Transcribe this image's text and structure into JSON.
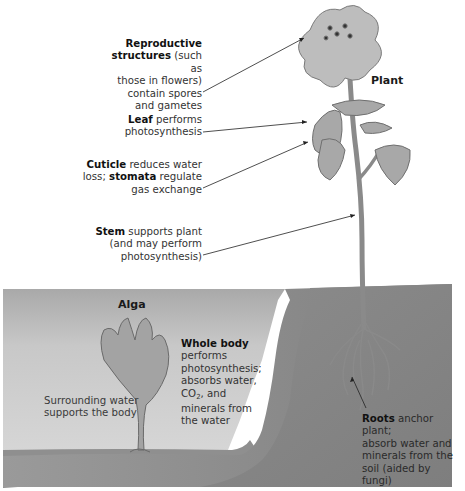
{
  "figure": {
    "organisms": {
      "plant": "Plant",
      "alga": "Alga"
    },
    "plant_labels": [
      {
        "id": "reproductive",
        "bold": "Reproductive structures",
        "text_lines": [
          "Reproductive",
          "structures (such as",
          "those in flowers)",
          "contain spores",
          "and gametes"
        ]
      },
      {
        "id": "leaf",
        "bold": "Leaf",
        "text_lines": [
          "Leaf performs",
          "photosynthesis"
        ]
      },
      {
        "id": "cuticle",
        "bold": [
          "Cuticle",
          "stomata"
        ],
        "text_lines": [
          "Cuticle reduces water",
          "loss; stomata regulate",
          "gas exchange"
        ]
      },
      {
        "id": "stem",
        "bold": "Stem",
        "text_lines": [
          "Stem supports plant",
          "(and may perform",
          "photosynthesis)"
        ]
      },
      {
        "id": "roots",
        "bold": "Roots",
        "text_lines": [
          "Roots anchor plant;",
          "absorb water and",
          "minerals from the",
          "soil (aided by fungi)"
        ]
      }
    ],
    "alga_labels": [
      {
        "id": "surrounding-water",
        "text_lines": [
          "Surrounding water",
          "supports the body"
        ]
      },
      {
        "id": "whole-body",
        "bold": "Whole body",
        "text_lines": [
          "Whole body",
          "performs",
          "photosynthesis;",
          "absorbs water,",
          "CO2, and",
          "minerals from",
          "the water"
        ]
      }
    ],
    "text": {
      "repro_bold1": "Reproductive",
      "repro_bold2": "structures",
      "repro_rest2": " (such as",
      "repro_l3": "those in flowers)",
      "repro_l4": "contain spores",
      "repro_l5": "and gametes",
      "leaf_bold": "Leaf",
      "leaf_rest": " performs",
      "leaf_l2": "photosynthesis",
      "cuticle_bold": "Cuticle",
      "cuticle_rest": " reduces water",
      "cuticle_l2a": "loss; ",
      "cuticle_bold2": "stomata",
      "cuticle_l2b": " regulate",
      "cuticle_l3": "gas exchange",
      "stem_bold": "Stem",
      "stem_rest": " supports plant",
      "stem_l2": "(and may perform",
      "stem_l3": "photosynthesis)",
      "roots_bold": "Roots",
      "roots_rest": " anchor plant;",
      "roots_l2": "absorb water and",
      "roots_l3": "minerals from the",
      "roots_l4": "soil (aided by fungi)",
      "water_l1": "Surrounding water",
      "water_l2": "supports the body",
      "whole_bold": "Whole body",
      "whole_l2": "performs",
      "whole_l3": "photosynthesis;",
      "whole_l4": "absorbs water,",
      "whole_co": "CO",
      "whole_sub": "2",
      "whole_l5b": ", and",
      "whole_l6": "minerals from",
      "whole_l7": "the water"
    },
    "colors": {
      "water": "#c9c9c9",
      "soil": "#8e8e8e",
      "soil_dark": "#7a7a7a",
      "plant": "#a9a9a9",
      "background": "#ffffff"
    }
  }
}
